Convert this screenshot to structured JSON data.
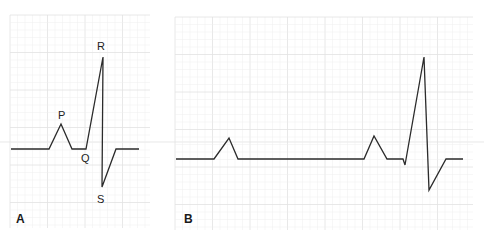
{
  "figure": {
    "panels": [
      {
        "id": "A",
        "label": "A",
        "grid": {
          "x": 10,
          "y": 15,
          "width": 140,
          "height": 213,
          "minor": 7.5,
          "major": 37.5,
          "minor_color": "#efefef",
          "major_color": "#e2e2e2"
        },
        "trace": [
          [
            11,
            149
          ],
          [
            49,
            149
          ],
          [
            61,
            124
          ],
          [
            72,
            149
          ],
          [
            86,
            149
          ],
          [
            103,
            57
          ],
          [
            102,
            187
          ],
          [
            116,
            149
          ],
          [
            139,
            149
          ]
        ],
        "wave_labels": [
          {
            "text": "P",
            "x": 58,
            "y": 119
          },
          {
            "text": "Q",
            "x": 81,
            "y": 162
          },
          {
            "text": "R",
            "x": 97,
            "y": 50
          },
          {
            "text": "S",
            "x": 97,
            "y": 203
          }
        ],
        "letter_pos": [
          16,
          223
        ]
      },
      {
        "id": "B",
        "label": "B",
        "grid": {
          "x": 175,
          "y": 17,
          "width": 298,
          "height": 213,
          "minor": 7.5,
          "major": 37.5,
          "minor_color": "#efefef",
          "major_color": "#e2e2e2"
        },
        "trace": [
          [
            176,
            159
          ],
          [
            214,
            159
          ],
          [
            229,
            138
          ],
          [
            238,
            159
          ],
          [
            364,
            159
          ],
          [
            374,
            136
          ],
          [
            387,
            159
          ],
          [
            403,
            159
          ],
          [
            405,
            165
          ],
          [
            424,
            57
          ],
          [
            429,
            190
          ],
          [
            446,
            159
          ],
          [
            463,
            159
          ]
        ],
        "wave_labels": [],
        "letter_pos": [
          184,
          223
        ]
      }
    ],
    "trace_color": "#2b2b2b",
    "reference_line": {
      "y": 142,
      "color": "#d8d8d8"
    }
  }
}
